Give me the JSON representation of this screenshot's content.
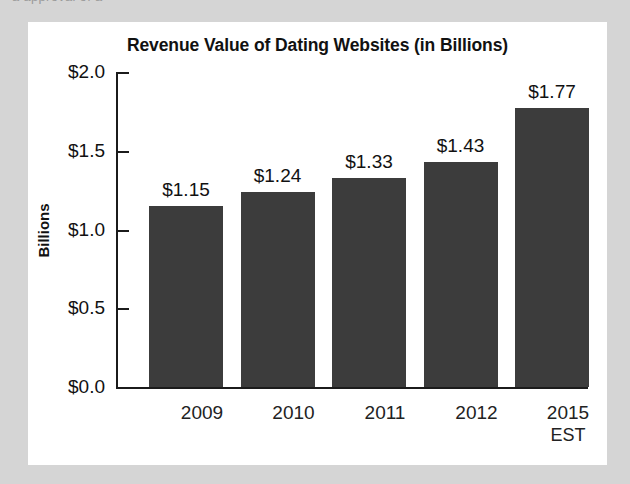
{
  "page": {
    "background_color": "#d5d5d5",
    "card_color": "#ffffff",
    "clipped_top_text": "a approval of a"
  },
  "chart_data": {
    "type": "bar",
    "title": "Revenue Value of Dating Websites (in Billions)",
    "xlabel": "",
    "ylabel": "Billions",
    "categories": [
      "2009",
      "2010",
      "2011",
      "2012",
      "2015"
    ],
    "category_sublabels": [
      "",
      "",
      "",
      "",
      "EST"
    ],
    "values": [
      1.15,
      1.24,
      1.33,
      1.43,
      1.77
    ],
    "value_labels": [
      "$1.15",
      "$1.24",
      "$1.33",
      "$1.43",
      "$1.77"
    ],
    "ylim": [
      0.0,
      2.0
    ],
    "ytick_values": [
      0.0,
      0.5,
      1.0,
      1.5,
      2.0
    ],
    "ytick_labels": [
      "$0.0",
      "$0.5",
      "$1.0",
      "$1.5",
      "$2.0"
    ],
    "grid": false,
    "legend": false,
    "bar_color": "#3c3c3c",
    "axis_color": "#1b1b1b",
    "text_color": "#111111"
  }
}
